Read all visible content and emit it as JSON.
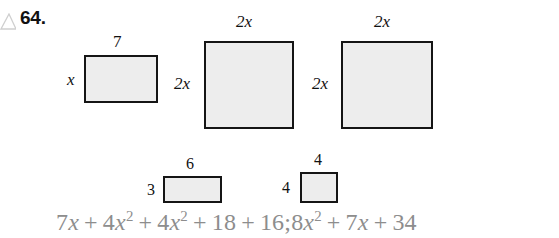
{
  "exercise": {
    "marker_icon": "triangle-outline-icon",
    "number": "64."
  },
  "figures": [
    {
      "id": "rect-7-by-x",
      "top_label": "7",
      "left_label": "x",
      "left_label_italic": true,
      "x": 84,
      "y": 55,
      "w": 74,
      "h": 48
    },
    {
      "id": "square-2x-first",
      "top_label": "2x",
      "left_label": "2x",
      "left_label_italic": true,
      "x": 204,
      "y": 41,
      "w": 90,
      "h": 88
    },
    {
      "id": "square-2x-second",
      "top_label": "2x",
      "left_label": "2x",
      "left_label_italic": true,
      "x": 341,
      "y": 41,
      "w": 92,
      "h": 88
    },
    {
      "id": "rect-6-by-3",
      "top_label": "6",
      "left_label": "3",
      "left_label_italic": false,
      "x": 163,
      "y": 176,
      "w": 59,
      "h": 27
    },
    {
      "id": "square-4-by-4",
      "top_label": "4",
      "left_label": "4",
      "left_label_italic": false,
      "x": 300,
      "y": 172,
      "w": 38,
      "h": 31
    }
  ],
  "answer": {
    "full_text": "7x + 4x² + 4x² + 18 + 16; 8x² + 7x + 34",
    "tokens": [
      {
        "t": "7",
        "kind": "num"
      },
      {
        "t": "x",
        "kind": "var"
      },
      {
        "t": "+",
        "kind": "op"
      },
      {
        "t": "4",
        "kind": "num"
      },
      {
        "t": "x",
        "kind": "var"
      },
      {
        "t": "2",
        "kind": "exp"
      },
      {
        "t": "+",
        "kind": "op"
      },
      {
        "t": "4",
        "kind": "num"
      },
      {
        "t": "x",
        "kind": "var"
      },
      {
        "t": "2",
        "kind": "exp"
      },
      {
        "t": "+",
        "kind": "op"
      },
      {
        "t": "18",
        "kind": "num"
      },
      {
        "t": "+",
        "kind": "op"
      },
      {
        "t": "16;",
        "kind": "num"
      },
      {
        "t": "8",
        "kind": "num"
      },
      {
        "t": "x",
        "kind": "var"
      },
      {
        "t": "2",
        "kind": "exp"
      },
      {
        "t": "+",
        "kind": "op"
      },
      {
        "t": "7",
        "kind": "num"
      },
      {
        "t": "x",
        "kind": "var"
      },
      {
        "t": "+",
        "kind": "op"
      },
      {
        "t": "34",
        "kind": "num"
      }
    ]
  },
  "colors": {
    "figure_fill": "#ededed",
    "figure_stroke": "#151515",
    "answer_text": "#8d8d8d",
    "body_text": "#111111",
    "page_background": "#ffffff"
  }
}
